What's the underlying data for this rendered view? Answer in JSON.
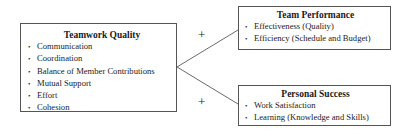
{
  "diagram": {
    "nodes": [
      {
        "id": "teamwork-quality",
        "title": "Teamwork Quality",
        "items": [
          "Communication",
          "Coordination",
          "Balance of Member Contributions",
          "Mutual Support",
          "Effort",
          "Cohesion"
        ]
      },
      {
        "id": "team-performance",
        "title": "Team Performance",
        "items": [
          "Effectiveness (Quality)",
          "Efficiency (Schedule and Budget)"
        ]
      },
      {
        "id": "personal-success",
        "title": "Personal Success",
        "items": [
          "Work Satisfaction",
          "Learning (Knowledge and Skills)"
        ]
      }
    ],
    "edges": [
      {
        "from": "teamwork-quality",
        "to": "team-performance",
        "label": "+"
      },
      {
        "from": "teamwork-quality",
        "to": "personal-success",
        "label": "+"
      }
    ]
  }
}
